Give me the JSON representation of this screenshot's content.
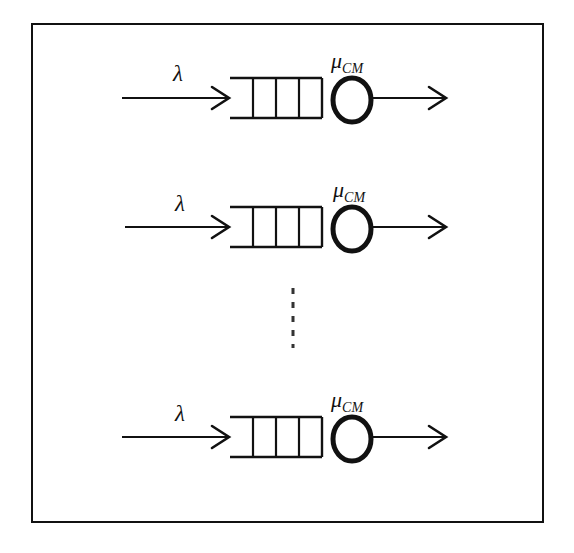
{
  "figure": {
    "background_color": "#ffffff",
    "stroke_color": "#111111",
    "frame": {
      "x": 32,
      "y": 24,
      "width": 511,
      "height": 498,
      "border_color": "#111111",
      "border_width": 2
    },
    "ellipsis": {
      "symbol": "vertical-dashed-ellipsis",
      "x": 293,
      "y_start": 288,
      "y_end": 348,
      "dash_count": 5,
      "color": "#333333"
    },
    "rows": [
      {
        "id": "queue-row-1",
        "center_y": 98,
        "arrival_label": "λ",
        "service_label_base": "μ",
        "service_label_subscript": "CM",
        "queue_slots": 4,
        "arrow_in": {
          "x_start": 122,
          "x_end": 228
        },
        "queue_box": {
          "x": 230,
          "y_top": 78,
          "width": 92,
          "height": 40
        },
        "server": {
          "cx": 352,
          "cy": 100,
          "rx": 19,
          "ry": 22,
          "stroke_width": 5
        },
        "arrow_out": {
          "x_start": 371,
          "x_end": 445
        }
      },
      {
        "id": "queue-row-2",
        "center_y": 227,
        "arrival_label": "λ",
        "service_label_base": "μ",
        "service_label_subscript": "CM",
        "queue_slots": 4,
        "arrow_in": {
          "x_start": 125,
          "x_end": 228
        },
        "queue_box": {
          "x": 230,
          "y_top": 207,
          "width": 92,
          "height": 40
        },
        "server": {
          "cx": 352,
          "cy": 229,
          "rx": 19,
          "ry": 22,
          "stroke_width": 5
        },
        "arrow_out": {
          "x_start": 371,
          "x_end": 445
        }
      },
      {
        "id": "queue-row-3",
        "center_y": 437,
        "arrival_label": "λ",
        "service_label_base": "μ",
        "service_label_subscript": "CM",
        "queue_slots": 4,
        "arrow_in": {
          "x_start": 122,
          "x_end": 228
        },
        "queue_box": {
          "x": 230,
          "y_top": 417,
          "width": 92,
          "height": 40
        },
        "server": {
          "cx": 352,
          "cy": 439,
          "rx": 19,
          "ry": 22,
          "stroke_width": 5
        },
        "arrow_out": {
          "x_start": 371,
          "x_end": 445
        }
      }
    ]
  }
}
